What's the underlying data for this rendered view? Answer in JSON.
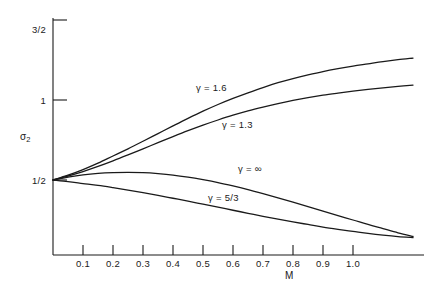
{
  "chart_data": {
    "type": "line",
    "title": "",
    "xlabel": "M",
    "ylabel": "σ₂",
    "xlim": [
      0,
      1.22
    ],
    "ylim": [
      0,
      1.62
    ],
    "grid": false,
    "legend_position": "inline-curve-labels",
    "x_ticks": [
      "0.1",
      "0.2",
      "0.3",
      "0.4",
      "0.5",
      "0.6",
      "0.7",
      "0.8",
      "0.9",
      "1.0"
    ],
    "x_tick_values": [
      0.1,
      0.2,
      0.3,
      0.4,
      0.5,
      0.6,
      0.7,
      0.8,
      0.9,
      1.0
    ],
    "y_ticks": [
      "1/2",
      "1",
      "3/2"
    ],
    "y_tick_values": [
      0.5,
      1.0,
      1.5
    ],
    "series": [
      {
        "name": "γ = 1.6",
        "label": "γ = 1.6",
        "x": [
          0.0,
          0.05,
          0.1,
          0.15,
          0.2,
          0.25,
          0.3,
          0.35,
          0.4,
          0.45,
          0.5,
          0.55,
          0.6,
          0.65,
          0.7,
          0.75,
          0.8,
          0.85,
          0.9,
          0.95,
          1.0,
          1.05,
          1.1,
          1.15,
          1.2
        ],
        "values": [
          0.5,
          0.53,
          0.565,
          0.605,
          0.65,
          0.695,
          0.742,
          0.79,
          0.838,
          0.885,
          0.93,
          0.972,
          1.01,
          1.045,
          1.078,
          1.108,
          1.134,
          1.157,
          1.178,
          1.196,
          1.212,
          1.226,
          1.24,
          1.252,
          1.262
        ]
      },
      {
        "name": "γ = 1.3",
        "label": "γ = 1.3",
        "x": [
          0.0,
          0.05,
          0.1,
          0.15,
          0.2,
          0.25,
          0.3,
          0.35,
          0.4,
          0.45,
          0.5,
          0.55,
          0.6,
          0.65,
          0.7,
          0.75,
          0.8,
          0.85,
          0.9,
          0.95,
          1.0,
          1.05,
          1.1,
          1.15,
          1.2
        ],
        "values": [
          0.5,
          0.525,
          0.553,
          0.585,
          0.62,
          0.657,
          0.695,
          0.733,
          0.771,
          0.808,
          0.843,
          0.875,
          0.905,
          0.932,
          0.956,
          0.978,
          0.998,
          1.015,
          1.03,
          1.043,
          1.055,
          1.066,
          1.076,
          1.085,
          1.093
        ]
      },
      {
        "name": "γ = ∞",
        "label": "γ = ∞",
        "x": [
          0.0,
          0.05,
          0.1,
          0.15,
          0.2,
          0.25,
          0.3,
          0.35,
          0.4,
          0.45,
          0.5,
          0.55,
          0.6,
          0.65,
          0.7,
          0.75,
          0.8,
          0.85,
          0.9,
          0.95,
          1.0,
          1.05,
          1.1,
          1.15,
          1.2
        ],
        "values": [
          0.5,
          0.518,
          0.532,
          0.541,
          0.546,
          0.548,
          0.546,
          0.54,
          0.531,
          0.518,
          0.502,
          0.484,
          0.463,
          0.44,
          0.415,
          0.389,
          0.362,
          0.334,
          0.305,
          0.277,
          0.25,
          0.222,
          0.196,
          0.17,
          0.147
        ]
      },
      {
        "name": "γ = 5/3",
        "label": "γ = 5/3",
        "x": [
          0.0,
          0.05,
          0.1,
          0.15,
          0.2,
          0.25,
          0.3,
          0.35,
          0.4,
          0.45,
          0.5,
          0.55,
          0.6,
          0.65,
          0.7,
          0.75,
          0.8,
          0.85,
          0.9,
          0.95,
          1.0,
          1.05,
          1.1,
          1.15,
          1.2
        ],
        "values": [
          0.5,
          0.49,
          0.478,
          0.466,
          0.452,
          0.437,
          0.421,
          0.404,
          0.386,
          0.368,
          0.349,
          0.33,
          0.311,
          0.292,
          0.273,
          0.255,
          0.238,
          0.222,
          0.206,
          0.192,
          0.179,
          0.166,
          0.155,
          0.146,
          0.14
        ]
      }
    ],
    "curve_label_positions": [
      {
        "series": "γ = 1.6",
        "x": 0.43,
        "y": 1.06
      },
      {
        "series": "γ = 1.3",
        "x": 0.56,
        "y": 0.805
      },
      {
        "series": "γ = ∞",
        "x": 0.62,
        "y": 0.53
      },
      {
        "series": "γ = 5/3",
        "x": 0.52,
        "y": 0.35
      }
    ],
    "colors": {
      "axis": "#1a1a1a",
      "curve": "#1a1a1a",
      "background": "#ffffff"
    }
  }
}
